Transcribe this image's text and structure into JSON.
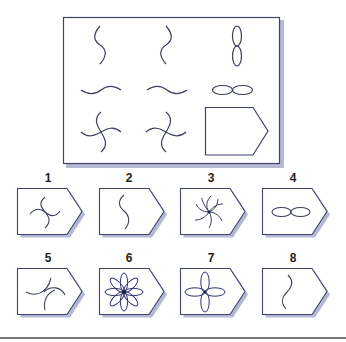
{
  "puzzle": {
    "matrix": {
      "rows": [
        [
          "s-curve-vertical",
          "s-curve-vertical-mirrored",
          "figure-eight-vertical"
        ],
        [
          "s-curve-horizontal",
          "s-curve-horizontal-mirrored",
          "figure-eight-horizontal"
        ],
        [
          "pinwheel-cross",
          "pinwheel-cross-mirrored",
          "missing"
        ]
      ]
    },
    "options": [
      {
        "number": "1",
        "figure": "pinwheel-cross"
      },
      {
        "number": "2",
        "figure": "s-curve-vertical"
      },
      {
        "number": "3",
        "figure": "eight-arm-spiral"
      },
      {
        "number": "4",
        "figure": "figure-eight-horizontal"
      },
      {
        "number": "5",
        "figure": "three-arc-swirl"
      },
      {
        "number": "6",
        "figure": "eight-petal-flower"
      },
      {
        "number": "7",
        "figure": "four-petal-flower"
      },
      {
        "number": "8",
        "figure": "s-curve-vertical-mirrored"
      }
    ]
  },
  "colors": {
    "stroke": "#3a3f5c",
    "frame": "#3d4270",
    "shadow": "#a9acc9",
    "divider": "#777777"
  }
}
